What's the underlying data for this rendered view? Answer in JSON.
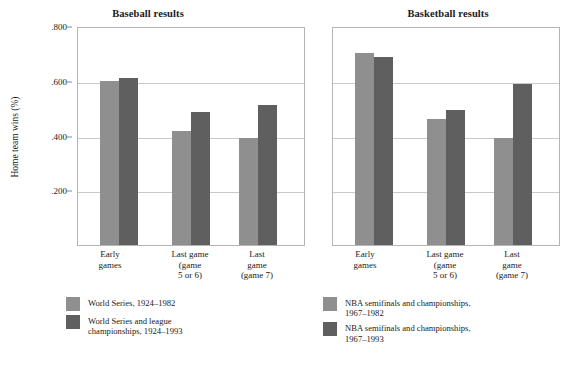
{
  "chart_data": [
    {
      "type": "bar",
      "title": "Baseball results",
      "xlabel": "",
      "ylabel": "Home team wins (%)",
      "ylim": [
        0,
        0.8
      ],
      "grid": true,
      "legend_position": "below",
      "yticks": [
        ".800",
        ".600",
        ".400",
        ".200"
      ],
      "ytick_values": [
        0.8,
        0.6,
        0.4,
        0.2
      ],
      "categories": [
        "Early games",
        "Last game (game 5 or 6)",
        "Last game (game 7)"
      ],
      "category_lines": [
        [
          "Early",
          "games"
        ],
        [
          "Last game",
          "(game",
          "5 or 6)"
        ],
        [
          "Last",
          "game",
          "(game 7)"
        ]
      ],
      "series": [
        {
          "name": "World Series, 1924–1982",
          "name_lines": [
            "World Series, 1924–1982"
          ],
          "color": "#8f8f8f",
          "values": [
            0.598,
            0.415,
            0.39
          ]
        },
        {
          "name": "World Series and league championships, 1924–1993",
          "name_lines": [
            "World Series and league",
            "championships, 1924–1993"
          ],
          "color": "#5f5f5f",
          "values": [
            0.61,
            0.487,
            0.512
          ]
        }
      ]
    },
    {
      "type": "bar",
      "title": "Basketball results",
      "xlabel": "",
      "ylabel": "",
      "ylim": [
        0,
        0.8
      ],
      "grid": true,
      "legend_position": "below",
      "yticks": [],
      "ytick_values": [
        0.8,
        0.6,
        0.4,
        0.2
      ],
      "categories": [
        "Early games",
        "Last game (game 5 or 6)",
        "Last game (game 7)"
      ],
      "category_lines": [
        [
          "Early",
          "games"
        ],
        [
          "Last game",
          "(game",
          "5 or 6)"
        ],
        [
          "Last",
          "game",
          "(game 7)"
        ]
      ],
      "series": [
        {
          "name": "NBA semifinals and championships, 1967–1982",
          "name_lines": [
            "NBA semifinals and championships,",
            "1967–1982"
          ],
          "color": "#8f8f8f",
          "values": [
            0.7,
            0.462,
            0.39
          ]
        },
        {
          "name": "NBA semifinals and championships, 1967–1993",
          "name_lines": [
            "NBA semifinals and championships,",
            "1967–1993"
          ],
          "color": "#5f5f5f",
          "values": [
            0.685,
            0.492,
            0.587
          ]
        }
      ]
    }
  ],
  "panels": {
    "baseball": {
      "title": "Baseball results",
      "ylabel": "Home team wins (%)",
      "yticks": [
        ".800",
        ".600",
        ".400",
        ".200"
      ],
      "xlabels": [
        {
          "l1": "Early",
          "l2": "games",
          "l3": ""
        },
        {
          "l1": "Last game",
          "l2": "(game",
          "l3": "5 or 6)"
        },
        {
          "l1": "Last",
          "l2": "game",
          "l3": "(game 7)"
        }
      ],
      "legend": [
        {
          "l1": "World Series, 1924–1982",
          "l2": "",
          "color": "#8f8f8f"
        },
        {
          "l1": "World Series and league",
          "l2": "championships, 1924–1993",
          "color": "#5f5f5f"
        }
      ]
    },
    "basketball": {
      "title": "Basketball results",
      "xlabels": [
        {
          "l1": "Early",
          "l2": "games",
          "l3": ""
        },
        {
          "l1": "Last game",
          "l2": "(game",
          "l3": "5 or 6)"
        },
        {
          "l1": "Last",
          "l2": "game",
          "l3": "(game 7)"
        }
      ],
      "legend": [
        {
          "l1": "NBA semifinals and championships,",
          "l2": "1967–1982",
          "color": "#8f8f8f"
        },
        {
          "l1": "NBA semifinals and championships,",
          "l2": "1967–1993",
          "color": "#5f5f5f"
        }
      ]
    }
  }
}
